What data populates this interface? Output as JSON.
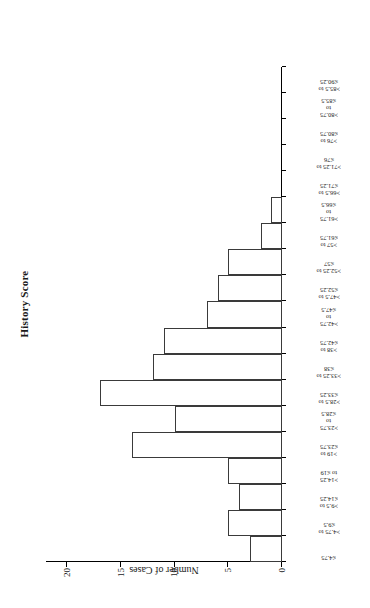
{
  "chart_data": {
    "type": "bar",
    "title": "History Score",
    "xlabel": "",
    "ylabel": "Number of Cases",
    "ylim": [
      0,
      22
    ],
    "yticks": [
      0,
      5,
      10,
      15,
      20
    ],
    "ytick_labels": [
      "0",
      "5",
      "10",
      "15",
      "20"
    ],
    "grid": false,
    "legend": "none",
    "orientation": "rotated-90-vertical-bars",
    "categories": [
      "≤4.75",
      ">4.75 to\n≤9.5",
      ">9.5 to\n≤14.25",
      ">14.25\nto ≤19",
      ">19 to\n≤23.75",
      ">23.75\nto\n≤28.5",
      ">28.5 to\n≤33.25",
      ">33.25 to\n≤38",
      ">38 to\n≤42.75",
      ">42.75\nto\n≤47.5",
      ">47.5 to\n≤52.25",
      ">52.25 to\n≤57",
      ">57 to\n≤61.75",
      ">61.75\nto\n≤66.5",
      ">66.5 to\n≤71.25",
      ">71.25 to\n≤76",
      ">76 to\n≤80.75",
      ">80.75\nto\n≤85.5",
      ">85.5 to\n≤90.25"
    ],
    "values": [
      3,
      5,
      4,
      5,
      14,
      10,
      17,
      12,
      11,
      7,
      6,
      5,
      2,
      1,
      0,
      0,
      0,
      0,
      0
    ]
  },
  "colors": {
    "bar_fill": "#ffffff",
    "bar_stroke": "#3a3a3a",
    "axis": "#000000",
    "text": "#1a1a1a",
    "background": "#ffffff"
  }
}
